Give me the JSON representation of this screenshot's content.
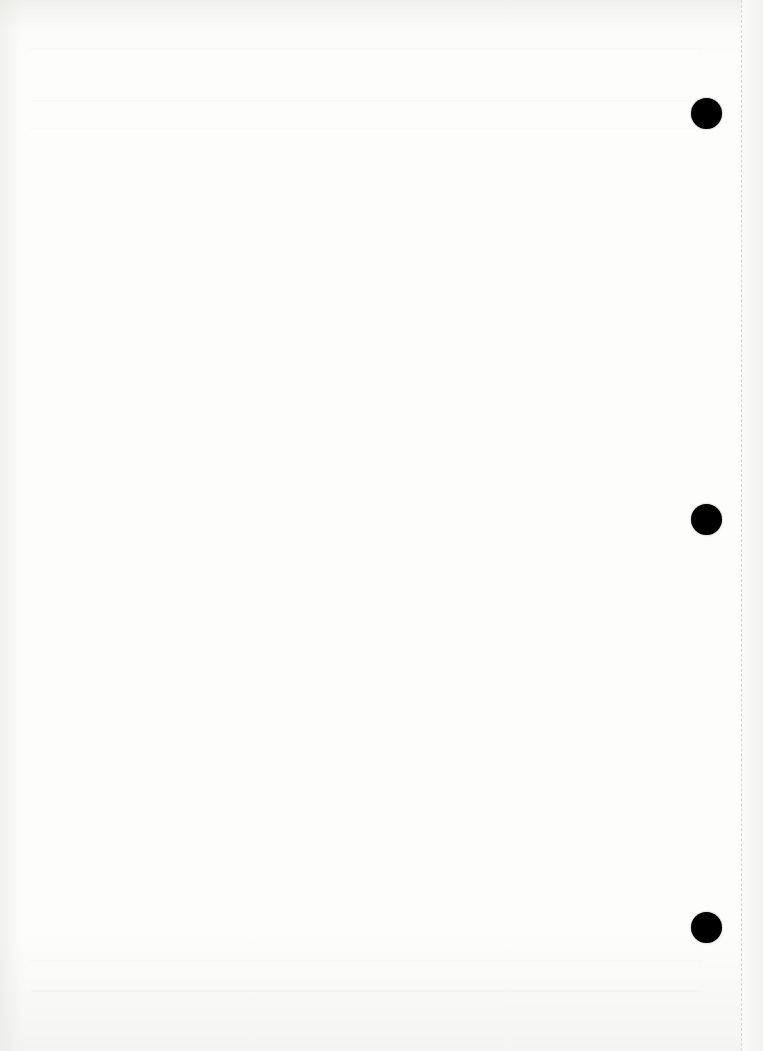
{
  "document": {
    "type": "blank-scanned-page",
    "text": ""
  },
  "punch_holes": [
    {
      "name": "top",
      "x": 691,
      "y": 98
    },
    {
      "name": "middle",
      "x": 691,
      "y": 504
    },
    {
      "name": "bottom",
      "x": 691,
      "y": 912
    }
  ],
  "colors": {
    "paper": "#fdfdfc",
    "hole": "#000000",
    "fold_line": "#d8d8d6"
  }
}
